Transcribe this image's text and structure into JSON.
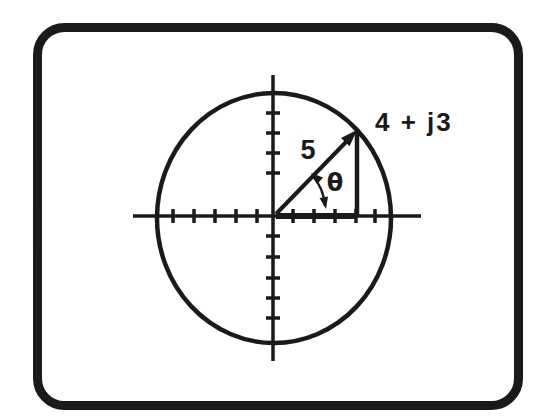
{
  "figure": {
    "labels": {
      "magnitude": "5",
      "angle": "θ",
      "point": "4 + j3"
    },
    "depicted_values": {
      "real_part": 4,
      "imaginary_part": 3,
      "magnitude": 5,
      "angle_symbol": "θ"
    },
    "colors": {
      "ink": "#1a1a1a",
      "background": "#ffffff"
    }
  }
}
